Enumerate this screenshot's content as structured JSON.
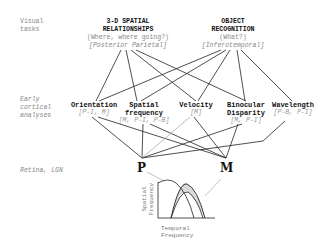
{
  "row_labels": {
    "visual_tasks": [
      "Visual",
      "tasks"
    ],
    "early_cortical": [
      "Early",
      "cortical",
      "analyses"
    ],
    "retina": "Retina, LGN"
  },
  "tasks": {
    "spatial": {
      "title": [
        "3-D SPATIAL",
        "RELATIONSHIPS"
      ],
      "subtitle": "(Where, where going?)",
      "area": "[Posterior Parietal]"
    },
    "object": {
      "title": [
        "OBJECT",
        "RECOGNITION"
      ],
      "subtitle": "(What?)",
      "area": "[Inferotemporal]"
    }
  },
  "analyses": [
    {
      "title": [
        "Orientation"
      ],
      "pathways": "[P-I, M]"
    },
    {
      "title": [
        "Spatial",
        "frequency"
      ],
      "pathways": "[M, P-I, P-B]"
    },
    {
      "title": [
        "Velocity"
      ],
      "pathways": "[M]"
    },
    {
      "title": [
        "Binocular",
        "Disparity"
      ],
      "pathways": "[M, P-I]"
    },
    {
      "title": [
        "Wavelength"
      ],
      "pathways": "[P-B, P-I]"
    }
  ],
  "channels": {
    "p": "P",
    "m": "M"
  },
  "graph": {
    "xlabel": [
      "Temporal",
      "Frequency"
    ],
    "ylabel": [
      "Spatial",
      "Frequency"
    ],
    "shade_color": "#d9d9d9"
  }
}
